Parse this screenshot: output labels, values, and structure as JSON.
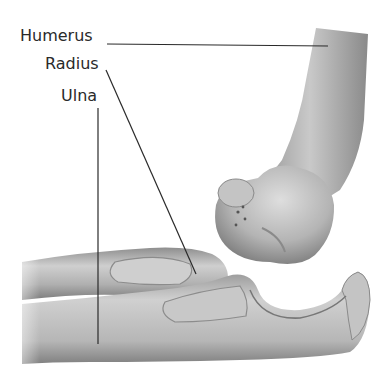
{
  "diagram": {
    "labels": [
      {
        "id": "humerus",
        "text": "Humerus"
      },
      {
        "id": "radius",
        "text": "Radius"
      },
      {
        "id": "ulna",
        "text": "Ulna"
      }
    ],
    "colors": {
      "background": "#ffffff",
      "bone_light": "#d6d6d6",
      "bone_mid": "#a8a8a8",
      "bone_dark": "#6e6e6e",
      "leader_line": "#2a2a2a",
      "label_text": "#2a2a2a"
    }
  }
}
